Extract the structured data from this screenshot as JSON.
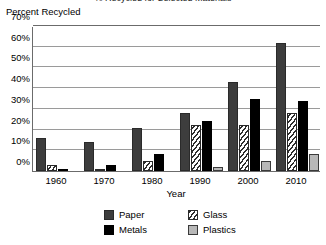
{
  "chart_data": {
    "type": "bar",
    "title": "% Recycled for Selected Materials",
    "ylabel": "Percent Recycled",
    "xlabel": "Year",
    "categories": [
      "1960",
      "1970",
      "1980",
      "1990",
      "2000",
      "2010"
    ],
    "series": [
      {
        "name": "Paper",
        "values": [
          16,
          14,
          21,
          28,
          43,
          62
        ]
      },
      {
        "name": "Glass",
        "values": [
          3,
          1,
          5,
          22,
          22,
          28
        ]
      },
      {
        "name": "Metals",
        "values": [
          1,
          3,
          8,
          24,
          35,
          34
        ]
      },
      {
        "name": "Plastics",
        "values": [
          0,
          0,
          0,
          2,
          5,
          8
        ]
      }
    ],
    "ylim": [
      0,
      70
    ],
    "yticks": [
      "0%",
      "10%",
      "20%",
      "30%",
      "40%",
      "50%",
      "60%",
      "70%"
    ],
    "ytick_values": [
      0,
      10,
      20,
      30,
      40,
      50,
      60,
      70
    ],
    "grid": true,
    "legend_position": "bottom"
  },
  "legend": {
    "items": [
      {
        "label": "Paper",
        "swatch": "paper-swatch"
      },
      {
        "label": "Glass",
        "swatch": "glass-swatch"
      },
      {
        "label": "Metals",
        "swatch": "metals-swatch"
      },
      {
        "label": "Plastics",
        "swatch": "plastics-swatch"
      }
    ]
  }
}
